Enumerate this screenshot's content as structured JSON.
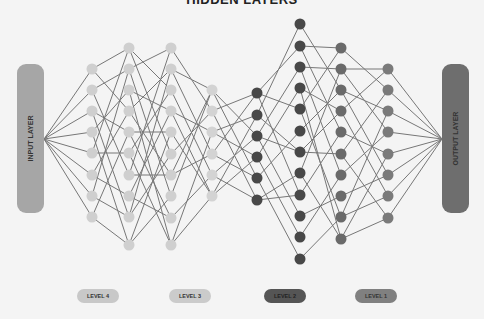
{
  "title": "HIDDEN LAYERS",
  "input_layer": {
    "label": "INPUT LAYER",
    "color": "#a6a6a6",
    "anchor": [
      44,
      139
    ]
  },
  "output_layer": {
    "label": "OUTPUT LAYER",
    "color": "#6e6e6e",
    "anchor": [
      442,
      139
    ]
  },
  "edge_color": "#777777",
  "columns": [
    {
      "x": 92,
      "color": "#cfcfcf",
      "ys": [
        69,
        90,
        111,
        132,
        153,
        175,
        196,
        217
      ]
    },
    {
      "x": 129,
      "color": "#cfcfcf",
      "ys": [
        48,
        69,
        90,
        111,
        132,
        153,
        175,
        196,
        217,
        245
      ]
    },
    {
      "x": 171,
      "color": "#cfcfcf",
      "ys": [
        48,
        69,
        90,
        111,
        132,
        154,
        175,
        196,
        218,
        245
      ]
    },
    {
      "x": 212,
      "color": "#d3d3d3",
      "ys": [
        90,
        111,
        132,
        154,
        175,
        196
      ]
    },
    {
      "x": 257,
      "color": "#484848",
      "ys": [
        93,
        115,
        136,
        157,
        178,
        200
      ]
    },
    {
      "x": 300,
      "color": "#484848",
      "ys": [
        24,
        46,
        67,
        88,
        109,
        131,
        152,
        173,
        195,
        216,
        237,
        259
      ]
    },
    {
      "x": 341,
      "color": "#6a6a6a",
      "ys": [
        48,
        69,
        90,
        111,
        132,
        154,
        175,
        196,
        217,
        239
      ]
    },
    {
      "x": 388,
      "color": "#7a7a7a",
      "ys": [
        69,
        90,
        111,
        132,
        154,
        175,
        196,
        218
      ]
    }
  ],
  "edges": [
    [
      [
        0,
        0
      ],
      [
        0,
        3
      ],
      [
        1,
        1
      ],
      [
        1,
        6
      ],
      [
        2,
        4
      ],
      [
        2,
        8
      ],
      [
        3,
        2
      ],
      [
        3,
        9
      ],
      [
        4,
        0
      ],
      [
        4,
        5
      ],
      [
        5,
        3
      ],
      [
        5,
        7
      ],
      [
        6,
        1
      ],
      [
        6,
        8
      ],
      [
        7,
        4
      ],
      [
        7,
        9
      ]
    ],
    [
      [
        0,
        2
      ],
      [
        0,
        5
      ],
      [
        1,
        0
      ],
      [
        1,
        7
      ],
      [
        2,
        3
      ],
      [
        2,
        9
      ],
      [
        3,
        1
      ],
      [
        3,
        6
      ],
      [
        4,
        4
      ],
      [
        4,
        8
      ],
      [
        5,
        2
      ],
      [
        5,
        9
      ],
      [
        6,
        0
      ],
      [
        6,
        6
      ],
      [
        7,
        3
      ],
      [
        7,
        8
      ],
      [
        8,
        5
      ],
      [
        8,
        1
      ],
      [
        9,
        7
      ],
      [
        9,
        4
      ]
    ],
    [
      [
        0,
        1
      ],
      [
        1,
        0
      ],
      [
        1,
        3
      ],
      [
        2,
        4
      ],
      [
        3,
        2
      ],
      [
        4,
        5
      ],
      [
        5,
        1
      ],
      [
        6,
        3
      ],
      [
        7,
        0
      ],
      [
        8,
        4
      ],
      [
        9,
        2
      ],
      [
        9,
        5
      ],
      [
        3,
        5
      ],
      [
        6,
        0
      ]
    ],
    [
      [
        0,
        2
      ],
      [
        0,
        4
      ],
      [
        1,
        0
      ],
      [
        1,
        5
      ],
      [
        2,
        1
      ],
      [
        2,
        3
      ],
      [
        3,
        0
      ],
      [
        3,
        4
      ],
      [
        4,
        2
      ],
      [
        4,
        5
      ],
      [
        5,
        1
      ],
      [
        5,
        3
      ]
    ],
    [
      [
        0,
        1
      ],
      [
        0,
        4
      ],
      [
        1,
        0
      ],
      [
        1,
        6
      ],
      [
        2,
        2
      ],
      [
        2,
        9
      ],
      [
        3,
        3
      ],
      [
        3,
        10
      ],
      [
        4,
        5
      ],
      [
        4,
        11
      ],
      [
        5,
        7
      ],
      [
        5,
        8
      ],
      [
        0,
        8
      ],
      [
        2,
        6
      ]
    ],
    [
      [
        0,
        2
      ],
      [
        1,
        0
      ],
      [
        1,
        4
      ],
      [
        2,
        1
      ],
      [
        2,
        6
      ],
      [
        3,
        3
      ],
      [
        4,
        0
      ],
      [
        4,
        8
      ],
      [
        5,
        2
      ],
      [
        6,
        5
      ],
      [
        7,
        1
      ],
      [
        7,
        9
      ],
      [
        8,
        4
      ],
      [
        9,
        7
      ],
      [
        10,
        6
      ],
      [
        11,
        8
      ],
      [
        3,
        9
      ],
      [
        6,
        3
      ]
    ],
    [
      [
        0,
        1
      ],
      [
        1,
        0
      ],
      [
        1,
        3
      ],
      [
        2,
        2
      ],
      [
        2,
        5
      ],
      [
        3,
        0
      ],
      [
        3,
        6
      ],
      [
        4,
        4
      ],
      [
        5,
        1
      ],
      [
        5,
        7
      ],
      [
        6,
        3
      ],
      [
        7,
        5
      ],
      [
        8,
        2
      ],
      [
        8,
        6
      ],
      [
        9,
        4
      ],
      [
        9,
        7
      ]
    ]
  ],
  "legend": [
    {
      "label": "LEVEL 4",
      "x": 77,
      "color": "#c8c8c8"
    },
    {
      "label": "LEVEL 3",
      "x": 169,
      "color": "#cbcbcb"
    },
    {
      "label": "LEVEL 2",
      "x": 264,
      "color": "#555555"
    },
    {
      "label": "LEVEL 1",
      "x": 355,
      "color": "#808080"
    }
  ]
}
